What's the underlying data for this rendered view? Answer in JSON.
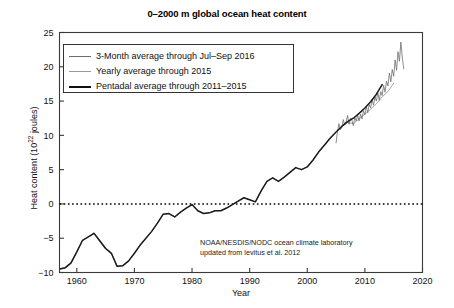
{
  "chart_data": {
    "type": "line",
    "title": "0–2000 m global ocean heat content",
    "xlabel": "Year",
    "ylabel": "Heat content (10^22 joules)",
    "ylabel_base": "Heat content (10",
    "ylabel_exp": "22",
    "ylabel_tail": " joules)",
    "xlim": [
      1957,
      2020
    ],
    "ylim": [
      -10,
      25
    ],
    "xticks": [
      1960,
      1970,
      1980,
      1990,
      2000,
      2010,
      2020
    ],
    "yticks": [
      25,
      20,
      15,
      10,
      5,
      0,
      -5,
      -10
    ],
    "grid": false,
    "zero_reference_line": 0,
    "legend_position": "upper-left",
    "annotation_lines": [
      "NOAA/NESDIS/NODC ocean climate laboratory",
      "updated from levitus et al. 2012"
    ],
    "series": [
      {
        "name": "3-Month average through Jul–Sep 2016",
        "color": "#6e6e6e",
        "width": 0.8,
        "x": [
          2005.0,
          2005.25,
          2005.5,
          2005.75,
          2006.0,
          2006.25,
          2006.5,
          2006.75,
          2007.0,
          2007.25,
          2007.5,
          2007.75,
          2008.0,
          2008.25,
          2008.5,
          2008.75,
          2009.0,
          2009.25,
          2009.5,
          2009.75,
          2010.0,
          2010.25,
          2010.5,
          2010.75,
          2011.0,
          2011.25,
          2011.5,
          2011.75,
          2012.0,
          2012.25,
          2012.5,
          2012.75,
          2013.0,
          2013.25,
          2013.5,
          2013.75,
          2014.0,
          2014.25,
          2014.5,
          2014.75,
          2015.0,
          2015.25,
          2015.5,
          2015.75,
          2016.0,
          2016.25,
          2016.5,
          2016.75
        ],
        "y": [
          8.9,
          10.6,
          11.7,
          10.8,
          11.2,
          12.3,
          11.5,
          12.0,
          12.9,
          11.6,
          12.5,
          12.2,
          11.4,
          12.6,
          12.1,
          12.9,
          12.1,
          13.1,
          12.4,
          13.6,
          13.0,
          14.2,
          13.3,
          14.5,
          14.0,
          15.3,
          14.4,
          15.6,
          15.0,
          16.2,
          15.1,
          16.4,
          15.8,
          17.3,
          16.3,
          17.9,
          17.2,
          19.1,
          17.8,
          19.6,
          18.6,
          21.0,
          19.5,
          22.2,
          20.8,
          23.6,
          21.3,
          19.7
        ]
      },
      {
        "name": "Yearly average through 2015",
        "color": "#8e8e8e",
        "width": 0.8,
        "x": [
          1957,
          1958,
          1959,
          1960,
          1961,
          1962,
          1963,
          1964,
          1965,
          1966,
          1967,
          1968,
          1969,
          1970,
          1971,
          1972,
          1973,
          1974,
          1975,
          1976,
          1977,
          1978,
          1979,
          1980,
          1981,
          1982,
          1983,
          1984,
          1985,
          1986,
          1987,
          1988,
          1989,
          1990,
          1991,
          1992,
          1993,
          1994,
          1995,
          1996,
          1997,
          1998,
          1999,
          2000,
          2001,
          2002,
          2003,
          2004,
          2005,
          2006,
          2007,
          2008,
          2009,
          2010,
          2011,
          2012,
          2013,
          2014,
          2015
        ],
        "y": [
          -9.5,
          -9.4,
          -8.7,
          -7.0,
          -5.3,
          -4.8,
          -4.2,
          -5.3,
          -6.4,
          -7.1,
          -9.1,
          -9.0,
          -8.3,
          -7.2,
          -6.0,
          -5.0,
          -4.0,
          -2.8,
          -1.5,
          -1.4,
          -1.9,
          -1.2,
          -0.6,
          -0.1,
          -1.0,
          -1.4,
          -1.3,
          -1.0,
          -1.0,
          -0.6,
          -0.1,
          0.4,
          0.9,
          0.6,
          0.3,
          1.9,
          3.3,
          3.8,
          3.3,
          3.9,
          4.6,
          5.3,
          5.0,
          5.4,
          6.4,
          7.6,
          8.6,
          9.6,
          10.5,
          11.3,
          11.9,
          11.7,
          12.4,
          13.1,
          13.8,
          14.6,
          15.6,
          16.4,
          17.6
        ]
      },
      {
        "name": "Pentadal average through 2011–2015",
        "color": "#1a1a1a",
        "width": 1.5,
        "x": [
          1957,
          1958,
          1959,
          1960,
          1961,
          1962,
          1963,
          1964,
          1965,
          1966,
          1967,
          1968,
          1969,
          1970,
          1971,
          1972,
          1973,
          1974,
          1975,
          1976,
          1977,
          1978,
          1979,
          1980,
          1981,
          1982,
          1983,
          1984,
          1985,
          1986,
          1987,
          1988,
          1989,
          1990,
          1991,
          1992,
          1993,
          1994,
          1995,
          1996,
          1997,
          1998,
          1999,
          2000,
          2001,
          2002,
          2003,
          2004,
          2005,
          2006,
          2007,
          2008,
          2009,
          2010,
          2011,
          2012,
          2013
        ],
        "y": [
          -9.5,
          -9.3,
          -8.6,
          -7.0,
          -5.3,
          -4.8,
          -4.3,
          -5.4,
          -6.5,
          -7.2,
          -9.1,
          -9.0,
          -8.3,
          -7.2,
          -6.0,
          -5.0,
          -4.0,
          -2.8,
          -1.5,
          -1.4,
          -1.9,
          -1.2,
          -0.6,
          -0.1,
          -1.0,
          -1.4,
          -1.3,
          -1.0,
          -1.0,
          -0.6,
          -0.1,
          0.4,
          0.9,
          0.6,
          0.3,
          1.9,
          3.3,
          3.8,
          3.3,
          3.9,
          4.6,
          5.3,
          5.0,
          5.4,
          6.4,
          7.6,
          8.6,
          9.6,
          10.5,
          11.3,
          12.0,
          12.5,
          13.2,
          14.0,
          14.9,
          16.0,
          17.4
        ]
      }
    ]
  },
  "legend": {
    "items": [
      {
        "label": "3-Month average through Jul–Sep 2016",
        "color": "#6e6e6e",
        "width": "1.3px"
      },
      {
        "label": "Yearly average through 2015",
        "color": "#9a9a9a",
        "width": "1px"
      },
      {
        "label": "Pentadal average through 2011–2015",
        "color": "#111111",
        "width": "2px"
      }
    ]
  }
}
